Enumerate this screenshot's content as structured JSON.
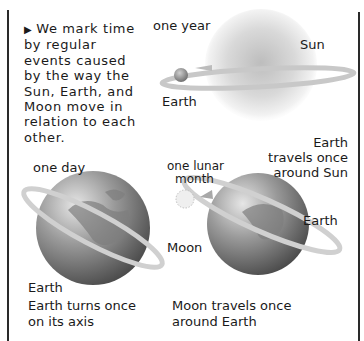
{
  "intro": {
    "bullet": "▶",
    "text": "We mark time by regular events caused by the way the Sun, Earth, and Moon move in relation to each other."
  },
  "panels": {
    "year": {
      "heading": "one year",
      "sun_label": "Sun",
      "earth_label": "Earth",
      "caption_line1": "Earth",
      "caption_line2": "travels once",
      "caption_line3": "around Sun"
    },
    "day": {
      "heading": "one day",
      "earth_label": "Earth",
      "caption_line1": "Earth turns once",
      "caption_line2": "on its axis"
    },
    "month": {
      "heading_line1": "one lunar",
      "heading_line2": "month",
      "moon_label": "Moon",
      "earth_label": "Earth",
      "caption_line1": "Moon travels once",
      "caption_line2": "around Earth"
    }
  },
  "colors": {
    "rule": "#2a2a2a",
    "text": "#1a1a1a",
    "orbit": "#c8c8c8",
    "globe_dark": "#5a5a5a",
    "globe_light": "#d8d8d8"
  }
}
